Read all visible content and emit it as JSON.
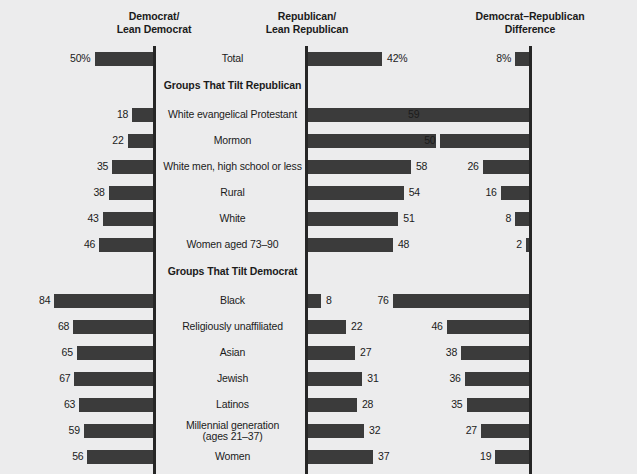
{
  "headers": {
    "democrat": {
      "line1": "Democrat/",
      "line2": "Lean Democrat"
    },
    "republican": {
      "line1": "Republican/",
      "line2": "Lean Republican"
    },
    "difference": {
      "line1": "Democrat–Republican",
      "line2": "Difference"
    }
  },
  "sections": {
    "tilt_republican": "Groups That Tilt Republican",
    "tilt_democrat": "Groups That Tilt Democrat"
  },
  "chart_data": {
    "type": "bar",
    "xlabel": "",
    "ylabel": "",
    "grid": false,
    "legend_position": "none",
    "orientation": "horizontal-diverging",
    "xlim": [
      0,
      100
    ],
    "series": [
      {
        "name": "Democrat/Lean Democrat",
        "direction": "left"
      },
      {
        "name": "Republican/Lean Republican",
        "direction": "right"
      },
      {
        "name": "Democrat–Republican Difference",
        "direction": "left"
      }
    ],
    "categories": [
      "Total",
      "White evangelical Protestant",
      "Mormon",
      "White men, high school or less",
      "Rural",
      "White",
      "Women aged 73–90",
      "Black",
      "Religiously unaffiliated",
      "Asian",
      "Jewish",
      "Latinos",
      "Millennial generation (ages 21–37)",
      "Women"
    ],
    "rows": [
      {
        "label": "Total",
        "label2": "",
        "section": "",
        "dem": 50,
        "rep": 42,
        "diff": 8,
        "dem_text": "50%",
        "rep_text": "42%",
        "diff_text": "8%"
      },
      {
        "label": "White evangelical Protestant",
        "label2": "",
        "section": "tilt_republican",
        "dem": 18,
        "rep": 77,
        "diff": 59,
        "dem_text": "18",
        "rep_text": "77",
        "diff_text": "59"
      },
      {
        "label": "Mormon",
        "label2": "",
        "section": "tilt_republican",
        "dem": 22,
        "rep": 72,
        "diff": 50,
        "dem_text": "22",
        "rep_text": "72",
        "diff_text": "50"
      },
      {
        "label": "White men, high school or less",
        "label2": "",
        "section": "tilt_republican",
        "dem": 35,
        "rep": 58,
        "diff": 26,
        "dem_text": "35",
        "rep_text": "58",
        "diff_text": "26"
      },
      {
        "label": "Rural",
        "label2": "",
        "section": "tilt_republican",
        "dem": 38,
        "rep": 54,
        "diff": 16,
        "dem_text": "38",
        "rep_text": "54",
        "diff_text": "16"
      },
      {
        "label": "White",
        "label2": "",
        "section": "tilt_republican",
        "dem": 43,
        "rep": 51,
        "diff": 8,
        "dem_text": "43",
        "rep_text": "51",
        "diff_text": "8"
      },
      {
        "label": "Women aged 73–90",
        "label2": "",
        "section": "tilt_republican",
        "dem": 46,
        "rep": 48,
        "diff": 2,
        "dem_text": "46",
        "rep_text": "48",
        "diff_text": "2"
      },
      {
        "label": "Black",
        "label2": "",
        "section": "tilt_democrat",
        "dem": 84,
        "rep": 8,
        "diff": 76,
        "dem_text": "84",
        "rep_text": "8",
        "diff_text": "76"
      },
      {
        "label": "Religiously unaffiliated",
        "label2": "",
        "section": "tilt_democrat",
        "dem": 68,
        "rep": 22,
        "diff": 46,
        "dem_text": "68",
        "rep_text": "22",
        "diff_text": "46"
      },
      {
        "label": "Asian",
        "label2": "",
        "section": "tilt_democrat",
        "dem": 65,
        "rep": 27,
        "diff": 38,
        "dem_text": "65",
        "rep_text": "27",
        "diff_text": "38"
      },
      {
        "label": "Jewish",
        "label2": "",
        "section": "tilt_democrat",
        "dem": 67,
        "rep": 31,
        "diff": 36,
        "dem_text": "67",
        "rep_text": "31",
        "diff_text": "36"
      },
      {
        "label": "Latinos",
        "label2": "",
        "section": "tilt_democrat",
        "dem": 63,
        "rep": 28,
        "diff": 35,
        "dem_text": "63",
        "rep_text": "28",
        "diff_text": "35"
      },
      {
        "label": "Millennial generation",
        "label2": "(ages 21–37)",
        "section": "tilt_democrat",
        "dem": 59,
        "rep": 32,
        "diff": 27,
        "dem_text": "59",
        "rep_text": "32",
        "diff_text": "27"
      },
      {
        "label": "Women",
        "label2": "",
        "section": "tilt_democrat",
        "dem": 56,
        "rep": 37,
        "diff": 19,
        "dem_text": "56",
        "rep_text": "37",
        "diff_text": "19"
      }
    ]
  },
  "style": {
    "bar_color": "#3b3b3b",
    "axis_color": "#262626",
    "background": "#ececed",
    "text_color": "#1b1b1b"
  }
}
